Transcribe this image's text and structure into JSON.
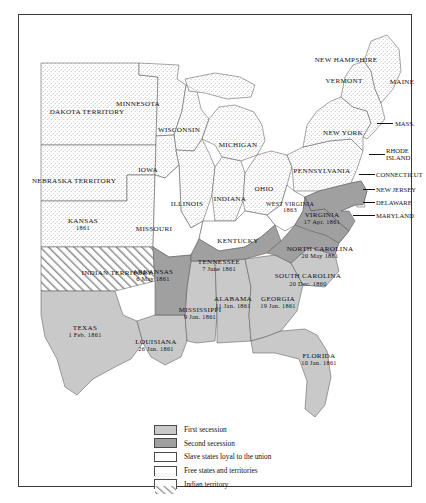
{
  "figure": {
    "kind": "historical-map"
  },
  "legend": {
    "items": [
      {
        "key": "first_secession",
        "label": "First secession",
        "swatch": "solid-light-gray",
        "color": "#c9c9c9"
      },
      {
        "key": "second_secession",
        "label": "Second secession",
        "swatch": "solid-dark-gray",
        "color": "#a0a0a0"
      },
      {
        "key": "loyal_slave",
        "label": "Slave states loyal to the union",
        "swatch": "white",
        "color": "#ffffff"
      },
      {
        "key": "free_states",
        "label": "Free states and territories",
        "swatch": "stippled",
        "color": "#ffffff"
      },
      {
        "key": "indian_territory",
        "label": "Indian territory",
        "swatch": "diagonal-hatch",
        "color": "#ffffff"
      }
    ]
  },
  "map": {
    "first_secession_states": [
      {
        "name": "SOUTH CAROLINA",
        "date": "20 Dec. 1860"
      },
      {
        "name": "MISSISSIPPI",
        "date": "9 Jan. 1861"
      },
      {
        "name": "FLORIDA",
        "date": "10 Jan. 1861"
      },
      {
        "name": "ALABAMA",
        "date": "11 Jan. 1861"
      },
      {
        "name": "GEORGIA",
        "date": "19 Jan. 1861"
      },
      {
        "name": "LOUISIANA",
        "date": "26 Jan. 1861"
      },
      {
        "name": "TEXAS",
        "date": "1 Feb. 1861"
      }
    ],
    "second_secession_states": [
      {
        "name": "VIRGINIA",
        "date": "17 Apr. 1861"
      },
      {
        "name": "ARKANSAS",
        "date": "6 May 1861"
      },
      {
        "name": "NORTH CAROLINA",
        "date": "20 May 1861"
      },
      {
        "name": "TENNESSEE",
        "date": "7 June 1861"
      }
    ],
    "labels": [
      {
        "id": "dakota-territory",
        "name": "DAKOTA TERRITORY",
        "date": "",
        "x": 68,
        "y": 98,
        "cls": "two"
      },
      {
        "id": "minnesota",
        "name": "MINNESOTA",
        "date": "",
        "x": 119,
        "y": 90,
        "cls": ""
      },
      {
        "id": "wisconsin",
        "name": "WISCONSIN",
        "date": "",
        "x": 160,
        "y": 116,
        "cls": ""
      },
      {
        "id": "michigan",
        "name": "MICHIGAN",
        "date": "",
        "x": 219,
        "y": 131,
        "cls": ""
      },
      {
        "id": "nebraska-territory",
        "name": "NEBRASKA TERRITORY",
        "date": "",
        "x": 55,
        "y": 167,
        "cls": "two"
      },
      {
        "id": "iowa",
        "name": "IOWA",
        "date": "",
        "x": 129,
        "y": 156,
        "cls": ""
      },
      {
        "id": "illinois",
        "name": "ILLINOIS",
        "date": "",
        "x": 168,
        "y": 190,
        "cls": ""
      },
      {
        "id": "indiana",
        "name": "INDIANA",
        "date": "",
        "x": 211,
        "y": 185,
        "cls": ""
      },
      {
        "id": "ohio",
        "name": "OHIO",
        "date": "",
        "x": 245,
        "y": 175,
        "cls": ""
      },
      {
        "id": "pennsylvania",
        "name": "PENNSYLVANIA",
        "date": "",
        "x": 303,
        "y": 157,
        "cls": ""
      },
      {
        "id": "new-york",
        "name": "NEW YORK",
        "date": "",
        "x": 324,
        "y": 119,
        "cls": "two"
      },
      {
        "id": "new-hampshire",
        "name": "NEW HAMPSHIRE",
        "date": "",
        "x": 327,
        "y": 46,
        "cls": ""
      },
      {
        "id": "vermont",
        "name": "VERMONT",
        "date": "",
        "x": 325,
        "y": 67,
        "cls": ""
      },
      {
        "id": "maine",
        "name": "MAINE",
        "date": "",
        "x": 383,
        "y": 68,
        "cls": ""
      },
      {
        "id": "kansas",
        "name": "KANSAS",
        "date": "1861",
        "x": 64,
        "y": 210,
        "cls": ""
      },
      {
        "id": "missouri",
        "name": "MISSOURI",
        "date": "",
        "x": 135,
        "y": 215,
        "cls": ""
      },
      {
        "id": "kentucky",
        "name": "KENTUCKY",
        "date": "",
        "x": 219,
        "y": 227,
        "cls": ""
      },
      {
        "id": "west-virginia",
        "name": "WEST VIRGINIA",
        "date": "1863",
        "x": 271,
        "y": 192,
        "cls": "two xs"
      },
      {
        "id": "virginia",
        "name": "VIRGINIA",
        "date": "17 Apr. 1861",
        "x": 303,
        "y": 204,
        "cls": ""
      },
      {
        "id": "indian-territory",
        "name": "INDIAN TERRITORY",
        "date": "",
        "x": 98,
        "y": 259,
        "cls": "two"
      },
      {
        "id": "arkansas",
        "name": "ARKANSAS",
        "date": "6 May 1861",
        "x": 134,
        "y": 261,
        "cls": ""
      },
      {
        "id": "tennessee",
        "name": "TENNESSEE",
        "date": "7 June 1861",
        "x": 200,
        "y": 251,
        "cls": ""
      },
      {
        "id": "north-carolina",
        "name": "NORTH CAROLINA",
        "date": "20 May 1861",
        "x": 301,
        "y": 238,
        "cls": ""
      },
      {
        "id": "south-carolina",
        "name": "SOUTH CAROLINA",
        "date": "20 Dec. 1860",
        "x": 289,
        "y": 265,
        "cls": "two"
      },
      {
        "id": "texas",
        "name": "TEXAS",
        "date": "1 Feb. 1861",
        "x": 66,
        "y": 317,
        "cls": ""
      },
      {
        "id": "mississippi",
        "name": "MISSISSIPPI",
        "date": "9 Jan. 1861",
        "x": 181,
        "y": 299,
        "cls": ""
      },
      {
        "id": "alabama",
        "name": "ALABAMA",
        "date": "11 Jan. 1861",
        "x": 214,
        "y": 288,
        "cls": ""
      },
      {
        "id": "georgia",
        "name": "GEORGIA",
        "date": "19 Jan. 1861",
        "x": 259,
        "y": 288,
        "cls": ""
      },
      {
        "id": "louisiana",
        "name": "LOUISIANA",
        "date": "26 Jan. 1861",
        "x": 137,
        "y": 331,
        "cls": ""
      },
      {
        "id": "florida",
        "name": "FLORIDA",
        "date": "10 Jan. 1861",
        "x": 300,
        "y": 345,
        "cls": ""
      }
    ],
    "leader_labels": [
      {
        "id": "mass",
        "name": "MASS.",
        "x": 378,
        "y": 108
      },
      {
        "id": "rhode-island",
        "name": "RHODE ISLAND",
        "x": 369,
        "y": 139
      },
      {
        "id": "connecticut",
        "name": "CONNECTICUT",
        "x": 359,
        "y": 159
      },
      {
        "id": "new-jersey",
        "name": "NEW JERSEY",
        "x": 359,
        "y": 174
      },
      {
        "id": "delaware",
        "name": "DELAWARE",
        "x": 359,
        "y": 187
      },
      {
        "id": "maryland",
        "name": "MARYLAND",
        "x": 359,
        "y": 200
      }
    ]
  }
}
